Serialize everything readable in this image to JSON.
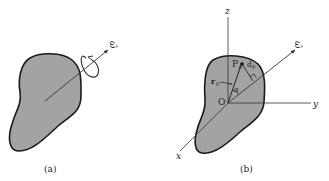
{
  "figure": {
    "panels": [
      {
        "id": "a",
        "caption": "(a)",
        "labels": {
          "omega_hat": "ω̂"
        }
      },
      {
        "id": "b",
        "caption": "(b)",
        "labels": {
          "z_axis": "z",
          "y_axis": "y",
          "x_axis": "x",
          "omega_hat": "ω̂",
          "origin": "O",
          "point": "P",
          "position_vector": "r",
          "position_vector_sub": "P",
          "distance": "d",
          "distance_sub": "P",
          "angle": "α"
        }
      }
    ],
    "colors": {
      "body_fill": "#a3a3a3",
      "outline": "#1a1a1a",
      "line": "#333333",
      "background": "#ffffff"
    }
  }
}
